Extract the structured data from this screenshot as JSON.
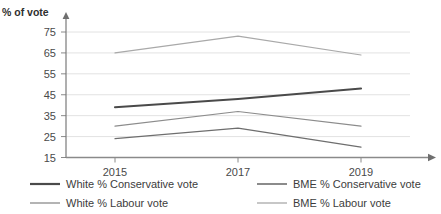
{
  "chart_data": {
    "type": "line",
    "title": "",
    "clipped_title_fragment": "",
    "xlabel": "",
    "ylabel": "% of vote",
    "x": [
      2015,
      2017,
      2019
    ],
    "xtick_labels": [
      "2015",
      "2017",
      "2019"
    ],
    "ytick_labels": [
      "15",
      "25",
      "35",
      "45",
      "55",
      "65",
      "75"
    ],
    "yticks": [
      15,
      25,
      35,
      45,
      55,
      65,
      75
    ],
    "ylim": [
      15,
      75
    ],
    "grid": true,
    "legend_position": "bottom",
    "series": [
      {
        "name": "White % Conservative vote",
        "values": [
          39,
          43,
          48
        ],
        "color": "#4a4a4a",
        "width": 2.1
      },
      {
        "name": "BME % Conservative vote",
        "values": [
          24,
          29,
          20
        ],
        "color": "#6e6e6e",
        "width": 1.2
      },
      {
        "name": "White % Labour vote",
        "values": [
          30,
          37,
          30
        ],
        "color": "#8c8c8c",
        "width": 1.2
      },
      {
        "name": "BME % Labour vote",
        "values": [
          65,
          73,
          64
        ],
        "color": "#a9a9a9",
        "width": 1.2
      }
    ]
  },
  "legend": {
    "items": [
      {
        "label": "White % Conservative vote",
        "color": "#4a4a4a"
      },
      {
        "label": "BME % Conservative vote",
        "color": "#6e6e6e"
      },
      {
        "label": "White % Labour vote",
        "color": "#8c8c8c"
      },
      {
        "label": "BME % Labour vote",
        "color": "#a9a9a9"
      }
    ]
  },
  "axis": {
    "y_axis_title": "% of vote"
  },
  "colors": {
    "gridline": "#e2e2e2",
    "axis": "#7a7a7a",
    "text": "#3c3c3c",
    "background": "#ffffff"
  }
}
